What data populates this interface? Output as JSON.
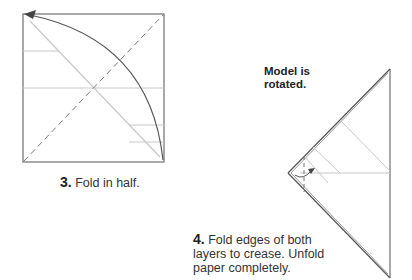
{
  "steps": [
    {
      "number": "3.",
      "text": "Fold in half."
    },
    {
      "number": "4.",
      "text": "Fold edges of both layers to crease.  Unfold paper completely.",
      "note": "Model is rotated."
    }
  ],
  "colors": {
    "paper_edge": "#6e6e6e",
    "crease": "#c8c8c8",
    "arrow": "#555555",
    "valley_fold": "#777777"
  }
}
